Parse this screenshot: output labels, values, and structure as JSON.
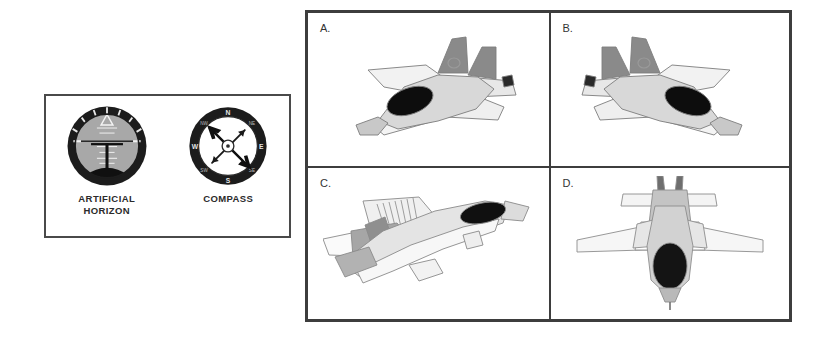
{
  "page": {
    "background_color": "#ffffff",
    "style": "grayscale line-art aptitude test figure"
  },
  "instrument_panel": {
    "border_color": "#4a4a4a",
    "instruments": [
      {
        "id": "artificial-horizon",
        "caption_line1": "ARTIFICIAL",
        "caption_line2": "HORIZON",
        "bezel_color": "#1c1c1c",
        "sky_color": "#a8a8a8",
        "ground_color": "#111111",
        "reading": "level, slight nose-up",
        "pointer": "triangle at top center"
      },
      {
        "id": "compass",
        "caption_line1": "COMPASS",
        "caption_line2": "",
        "bezel_color": "#1c1c1c",
        "face_color": "#ffffff",
        "needle_color": "#111111",
        "cardinal_points": [
          "N",
          "E",
          "S",
          "W"
        ],
        "ordinal_points": [
          "NE",
          "SE",
          "SW",
          "NW"
        ],
        "needle_heading": "needle points from NW to SE (approx 135 degrees)"
      }
    ]
  },
  "option_grid": {
    "border_color": "#3d3d3d",
    "rows": 2,
    "columns": 2,
    "options": [
      {
        "label": "A.",
        "view": "rear three-quarter view from above, aircraft banking and heading away to the upper-left",
        "nose_direction": "lower-left",
        "canopy_color": "#0d0d0d",
        "tail_color": "#8a8a8a",
        "body_color": "#d8d8d8"
      },
      {
        "label": "B.",
        "view": "rear three-quarter view from above, aircraft banking and heading away to the upper-right (mirror of A)",
        "nose_direction": "lower-right",
        "canopy_color": "#0d0d0d",
        "tail_color": "#8a8a8a",
        "body_color": "#d8d8d8"
      },
      {
        "label": "C.",
        "view": "underside three-quarter view, aircraft climbing toward the upper-right",
        "nose_direction": "upper-right",
        "canopy_color": "#0d0d0d",
        "tail_color": "#9a9a9a",
        "body_color": "#e2e2e2"
      },
      {
        "label": "D.",
        "view": "plan view from directly above, nose pointing toward the bottom of the frame",
        "nose_direction": "down",
        "canopy_color": "#141414",
        "tail_color": "#b8b8b8",
        "body_color": "#d2d2d2"
      }
    ]
  }
}
